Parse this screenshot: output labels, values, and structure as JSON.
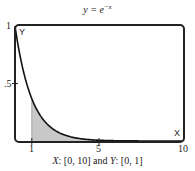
{
  "chart_data": {
    "type": "area",
    "function": "e^-x",
    "xlabel": "X",
    "ylabel": "Y",
    "xlim": [
      0,
      10
    ],
    "ylim": [
      0,
      1
    ],
    "x_ticks": [
      "1",
      "5",
      "10"
    ],
    "y_ticks": [
      "1",
      ".5"
    ],
    "shaded_region": {
      "x_from": 1,
      "x_to": 10,
      "description": "area under curve"
    },
    "x": [
      0,
      0.5,
      1,
      1.5,
      2,
      3,
      4,
      5,
      6,
      7,
      8,
      9,
      10
    ],
    "values": [
      1.0,
      0.607,
      0.368,
      0.223,
      0.135,
      0.05,
      0.018,
      0.007,
      0.002,
      0.001,
      0.0,
      0.0,
      0.0
    ],
    "caption": "X: [0, 10] and Y: [0, 1]",
    "grid": false
  },
  "title": {
    "prefix": "y = e",
    "exponent": "−x"
  },
  "axes": {
    "x_name": "X",
    "y_name": "Y",
    "y_tick_top": "1",
    "y_tick_mid": ".5",
    "x_tick_1": "1",
    "x_tick_5": "5",
    "x_tick_10": "10"
  },
  "caption": {
    "x_var": "X",
    "x_range": ": [0, 10] and ",
    "y_var": "Y",
    "y_range": ": [0, 1]"
  }
}
